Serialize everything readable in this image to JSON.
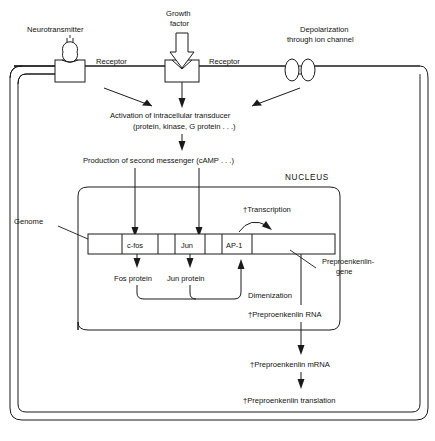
{
  "figure": {
    "type": "biological-signal-transduction-diagram",
    "title_visible": false,
    "background": "#ffffff",
    "ink": "#1a1a1a"
  },
  "stimuli": [
    {
      "id": "neurotransmitter",
      "label": "Neurotransmitter",
      "icon": "ligand-ball-and-stem",
      "receptor_label": "Receptor"
    },
    {
      "id": "growth-factor",
      "label_line1": "Growth",
      "label_line2": "factor",
      "icon": "down-block-arrow",
      "receptor_label": "Receptor"
    },
    {
      "id": "ion-channel",
      "label_line1": "Depolarization",
      "label_line2": "through ion channel",
      "icon": "double-ellipse-channel"
    }
  ],
  "cascade": {
    "activation_line1": "Activation of intracellular transducer",
    "activation_line2": "(protein, kinase, G protein . . .)",
    "second_messenger": "Production of second messenger (cAMP . . .)"
  },
  "nucleus": {
    "label": "NUCLEUS",
    "genome_label": "Genome",
    "transcription_label": "†Transcription",
    "genome_segments": [
      {
        "label": "",
        "kind": "spacer"
      },
      {
        "label": "c-fos",
        "kind": "gene"
      },
      {
        "label": "",
        "kind": "spacer"
      },
      {
        "label": "Jun",
        "kind": "gene"
      },
      {
        "label": "",
        "kind": "spacer"
      },
      {
        "label": "AP-1",
        "kind": "gene"
      },
      {
        "label": "",
        "kind": "spacer-preproenkenlin"
      }
    ],
    "products": [
      {
        "label": "Fos protein"
      },
      {
        "label": "Jun protein"
      }
    ],
    "dimerization_label": "Dimenization",
    "preproenkenlin_gene_line1": "Preproenkenlin-",
    "preproenkenlin_gene_line2": "gene",
    "rna_label": "†Preproenkenlin RNA"
  },
  "cytoplasm_output": {
    "mrna_label": "†Preproenkenlin mRNA",
    "translation_label": "†Preproenkenlin translation"
  }
}
